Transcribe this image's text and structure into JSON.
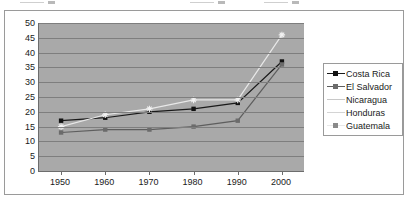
{
  "chart_data": {
    "type": "line",
    "title": "",
    "xlabel": "",
    "ylabel": "",
    "categories": [
      "1950",
      "1960",
      "1970",
      "1980",
      "1990",
      "2000"
    ],
    "ylim": [
      0,
      50
    ],
    "yticks": [
      "0",
      "5",
      "10",
      "15",
      "20",
      "25",
      "30",
      "35",
      "40",
      "45",
      "50"
    ],
    "grid": true,
    "legend_position": "right",
    "series": [
      {
        "name": "Costa Rica",
        "color": "#1a1a1a",
        "marker": "square-filled-dark",
        "values": [
          17,
          18,
          20,
          21,
          23,
          37
        ]
      },
      {
        "name": "El Salvador",
        "color": "#5e5e5e",
        "marker": "square-filled-gray",
        "values": [
          13,
          14,
          14,
          15,
          17,
          36
        ]
      },
      {
        "name": "Nicaragua",
        "color": "#c8c8c8",
        "marker": "none",
        "values": [
          null,
          null,
          null,
          null,
          null,
          null
        ]
      },
      {
        "name": "Honduras",
        "color": "#d4d4d4",
        "marker": "none",
        "values": [
          null,
          null,
          null,
          null,
          null,
          null
        ]
      },
      {
        "name": "Guatemala",
        "color": "#e8e8e8",
        "marker": "asterisk-light",
        "values": [
          15,
          19,
          21,
          24,
          24,
          46
        ]
      }
    ]
  },
  "legend": {
    "items": [
      {
        "label": "Costa Rica"
      },
      {
        "label": "El Salvador"
      },
      {
        "label": "Nicaragua"
      },
      {
        "label": "Honduras"
      },
      {
        "label": "Guatemala"
      }
    ]
  },
  "colors": {
    "plot_background": "#a9a9a9",
    "gridline": "#7e7e7e",
    "axis": "#6d6d6d",
    "frame_border": "#9a9a9a",
    "text": "#1a1a1a"
  }
}
